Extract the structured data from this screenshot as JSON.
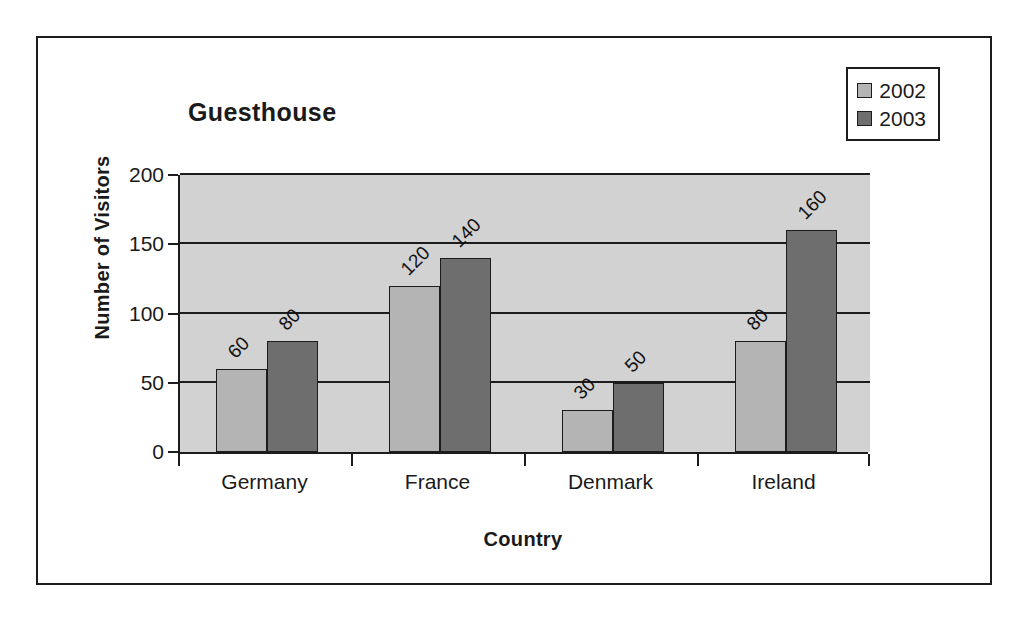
{
  "chart_data": {
    "type": "bar",
    "title": "Guesthouse",
    "xlabel": "Country",
    "ylabel": "Number of Visitors",
    "categories": [
      "Germany",
      "France",
      "Denmark",
      "Ireland"
    ],
    "series": [
      {
        "name": "2002",
        "color": "#b4b4b4",
        "values": [
          60,
          120,
          30,
          80
        ]
      },
      {
        "name": "2003",
        "color": "#6e6e6e",
        "values": [
          80,
          140,
          50,
          160
        ]
      }
    ],
    "ylim": [
      0,
      200
    ],
    "yticks": [
      0,
      50,
      100,
      150,
      200
    ],
    "ytick_labels": [
      "0",
      "50",
      "100",
      "150",
      "200"
    ],
    "grid": true,
    "show_data_labels": true,
    "data_label_rotation": -45,
    "legend_position": "top-right",
    "plot_background": "#d2d2d2",
    "axis_color": "#1c1c1c"
  },
  "legend": {
    "entries": [
      {
        "label": "2002",
        "color": "#b4b4b4"
      },
      {
        "label": "2003",
        "color": "#6e6e6e"
      }
    ]
  }
}
